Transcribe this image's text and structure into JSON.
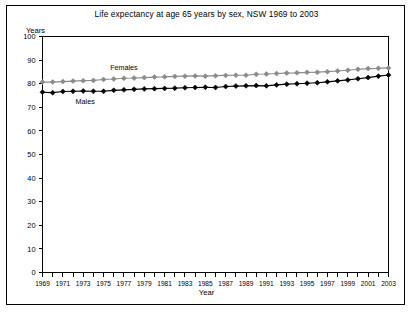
{
  "chart_data": {
    "type": "line",
    "title": "Life expectancy at age 65 years by sex, NSW 1969 to 2003",
    "xlabel": "Year",
    "ylabel": "Years",
    "ylim": [
      0,
      100
    ],
    "ytick_step": 10,
    "yticks": [
      "0",
      "10",
      "20",
      "30",
      "40",
      "50",
      "60",
      "70",
      "80",
      "90",
      "100"
    ],
    "xlim": [
      1969,
      2003
    ],
    "x": [
      1969,
      1970,
      1971,
      1972,
      1973,
      1974,
      1975,
      1976,
      1977,
      1978,
      1979,
      1980,
      1981,
      1982,
      1983,
      1984,
      1985,
      1986,
      1987,
      1988,
      1989,
      1990,
      1991,
      1992,
      1993,
      1994,
      1995,
      1996,
      1997,
      1998,
      1999,
      2000,
      2001,
      2002,
      2003
    ],
    "xticks_labeled": [
      "1969",
      "1971",
      "1973",
      "1975",
      "1977",
      "1979",
      "1981",
      "1983",
      "1985",
      "1987",
      "1989",
      "1991",
      "1993",
      "1995",
      "1997",
      "1999",
      "2001",
      "2003"
    ],
    "grid": false,
    "legend_position": "inline-annotation",
    "series": [
      {
        "name": "Females",
        "color": "#8a8a8a",
        "marker": "diamond",
        "annotation": "Females",
        "values": [
          80.7,
          80.7,
          80.9,
          81.1,
          81.3,
          81.4,
          81.8,
          82.0,
          82.3,
          82.4,
          82.6,
          82.8,
          82.9,
          83.1,
          83.2,
          83.3,
          83.2,
          83.4,
          83.5,
          83.6,
          83.6,
          84.0,
          84.1,
          84.3,
          84.5,
          84.6,
          84.8,
          84.9,
          85.1,
          85.4,
          85.7,
          86.1,
          86.4,
          86.5,
          86.7
        ]
      },
      {
        "name": "Males",
        "color": "#000000",
        "marker": "diamond",
        "annotation": "Males",
        "values": [
          76.4,
          76.2,
          76.7,
          76.8,
          76.9,
          76.8,
          76.8,
          77.2,
          77.4,
          77.6,
          77.8,
          77.9,
          78.0,
          78.1,
          78.3,
          78.4,
          78.5,
          78.4,
          78.8,
          79.0,
          79.1,
          79.2,
          79.1,
          79.5,
          79.8,
          80.0,
          80.2,
          80.4,
          80.8,
          81.2,
          81.6,
          82.1,
          82.6,
          83.2,
          83.7
        ]
      }
    ]
  }
}
